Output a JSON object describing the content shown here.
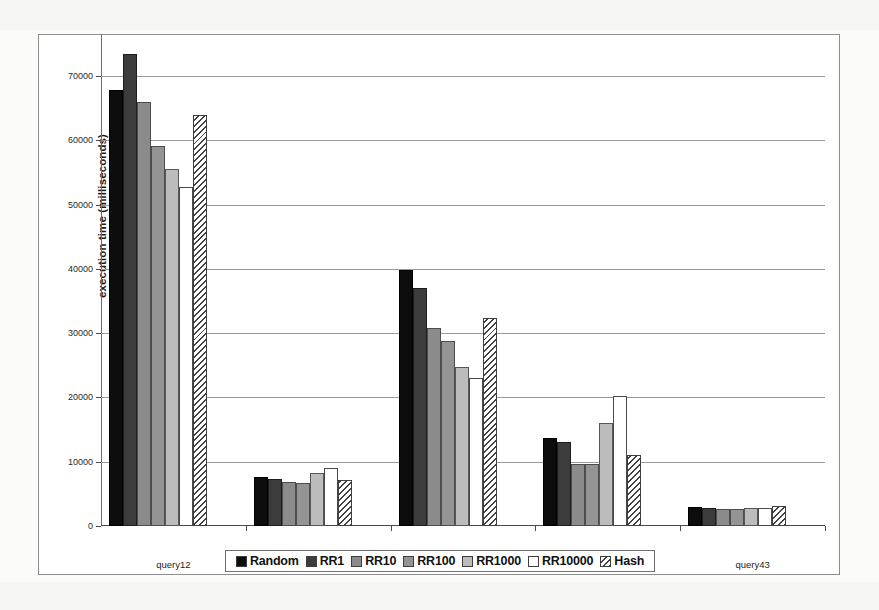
{
  "chart_data": {
    "type": "bar",
    "title": "",
    "subtitle": "",
    "xlabel": "",
    "ylabel": "execution time (milliseconds)",
    "categories": [
      "query12",
      "query17",
      "query24",
      "query25",
      "query43"
    ],
    "series": [
      {
        "name": "Random",
        "color": "#0d0d0d",
        "pattern": "solid",
        "values": [
          67800,
          7700,
          39800,
          13700,
          2950
        ]
      },
      {
        "name": "RR1",
        "color": "#3c3c3c",
        "pattern": "solid",
        "values": [
          73400,
          7300,
          37000,
          13000,
          2850
        ]
      },
      {
        "name": "RR10",
        "color": "#8b8b8b",
        "pattern": "solid",
        "values": [
          66000,
          6800,
          30800,
          9700,
          2700
        ]
      },
      {
        "name": "RR100",
        "color": "#949494",
        "pattern": "solid",
        "values": [
          59200,
          6700,
          28800,
          9600,
          2700
        ]
      },
      {
        "name": "RR1000",
        "color": "#bcbcbc",
        "pattern": "solid",
        "values": [
          55600,
          8200,
          24700,
          16000,
          2800
        ]
      },
      {
        "name": "RR10000",
        "color": "#ffffff",
        "pattern": "solid",
        "values": [
          52700,
          9000,
          23000,
          20300,
          2850
        ]
      },
      {
        "name": "Hash",
        "color": "#ffffff",
        "pattern": "diagonal-hatch",
        "values": [
          64000,
          7100,
          32400,
          11000,
          3050
        ]
      }
    ],
    "ylim": [
      0,
      75000
    ],
    "y_ticks": [
      0,
      10000,
      20000,
      30000,
      40000,
      50000,
      60000,
      70000
    ],
    "y_tick_labels": [
      "0",
      "10000",
      "20000",
      "30000",
      "40000",
      "50000",
      "60000",
      "70000"
    ],
    "grid": true,
    "grid_axis": "y",
    "legend_position": "bottom",
    "legend_entries": [
      "Random",
      "RR1",
      "RR10",
      "RR100",
      "RR1000",
      "RR10000",
      "Hash"
    ]
  }
}
